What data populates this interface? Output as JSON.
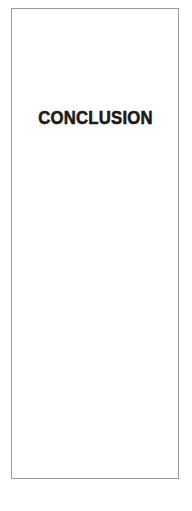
{
  "document": {
    "type": "section-divider-page",
    "background_color": "#ffffff"
  },
  "page_frame": {
    "border_color": "#9a9a9a",
    "fill_color": "#ffffff",
    "border_width_px": 1
  },
  "heading": {
    "title": "CONCLUSION",
    "text_color": "#1a1a1a",
    "align": "center",
    "case": "uppercase",
    "weight": "bold"
  }
}
